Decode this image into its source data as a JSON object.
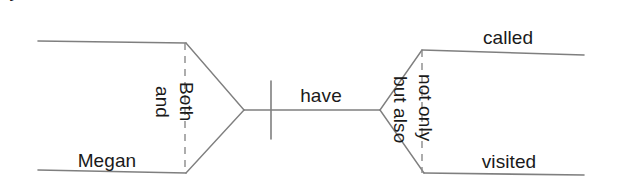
{
  "diagram": {
    "type": "reed-kellogg-sentence-diagram",
    "sentence": "Both Amy and Megan have not only called but also visited",
    "colors": {
      "background": "#ffffff",
      "line": "#7f7f7f",
      "dashed_line": "#8a8a8a",
      "text": "#1a1a1a"
    },
    "labels": {
      "subject_one": "Amy",
      "subject_two": "Megan",
      "subject_conjunction": "and",
      "subject_correlative": "Both",
      "verb": "have",
      "object_one": "called",
      "object_two": "visited",
      "object_conjunction": "but also",
      "object_correlative": "not only"
    },
    "lines": {
      "subject_top": {
        "x1": 38,
        "y1": 41,
        "x2": 186,
        "y2": 43
      },
      "subject_bottom": {
        "x1": 38,
        "y1": 170,
        "x2": 186,
        "y2": 173
      },
      "subject_diag_top": {
        "x1": 186,
        "y1": 43,
        "x2": 244,
        "y2": 110
      },
      "subject_diag_bottom": {
        "x1": 186,
        "y1": 173,
        "x2": 244,
        "y2": 110
      },
      "subject_dashed": {
        "x1": 185,
        "y1": 43,
        "x2": 185,
        "y2": 173
      },
      "baseline": {
        "x1": 244,
        "y1": 110,
        "x2": 380,
        "y2": 110
      },
      "verb_divider": {
        "x1": 271,
        "y1": 81,
        "x2": 271,
        "y2": 139
      },
      "object_diag_top": {
        "x1": 380,
        "y1": 110,
        "x2": 422,
        "y2": 50
      },
      "object_diag_bottom": {
        "x1": 380,
        "y1": 110,
        "x2": 424,
        "y2": 173
      },
      "object_dashed": {
        "x1": 422,
        "y1": 50,
        "x2": 422,
        "y2": 173
      },
      "object_top": {
        "x1": 422,
        "y1": 50,
        "x2": 584,
        "y2": 55
      },
      "object_bottom": {
        "x1": 424,
        "y1": 173,
        "x2": 584,
        "y2": 175
      }
    }
  }
}
